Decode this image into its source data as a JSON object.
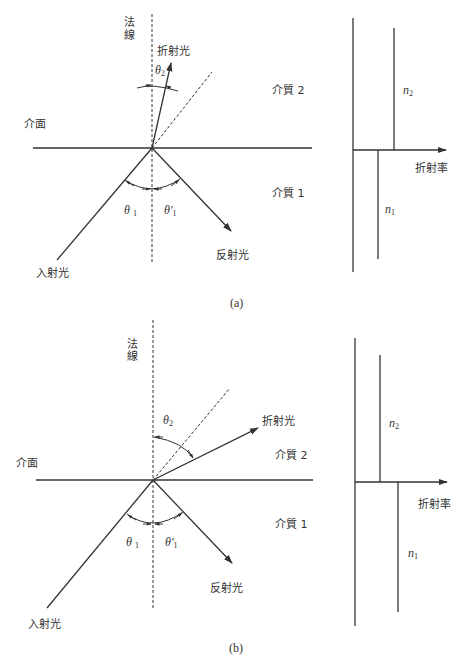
{
  "figure_a": {
    "caption": "(a)",
    "labels": {
      "normal_line_1": "法",
      "normal_line_2": "線",
      "refracted_light": "折射光",
      "interface": "介面",
      "medium_2": "介質 2",
      "medium_1": "介質 1",
      "incident_light": "入射光",
      "reflected_light": "反射光",
      "theta2": "θ",
      "theta2_sub": "2",
      "theta1": "θ",
      "theta1_sub": "1",
      "theta1p": "θ′",
      "theta1p_sub": "1"
    },
    "index_chart": {
      "axis_label": "折射率",
      "n2_label": "n",
      "n2_sub": "2",
      "n1_label": "n",
      "n1_sub": "1",
      "relation": "n2 > n1"
    }
  },
  "figure_b": {
    "caption": "(b)",
    "labels": {
      "normal_line_1": "法",
      "normal_line_2": "線",
      "refracted_light": "折射光",
      "interface": "介面",
      "medium_2": "介質 2",
      "medium_1": "介質 1",
      "incident_light": "入射光",
      "reflected_light": "反射光",
      "theta2": "θ",
      "theta2_sub": "2",
      "theta1": "θ",
      "theta1_sub": "1",
      "theta1p": "θ′",
      "theta1p_sub": "1"
    },
    "index_chart": {
      "axis_label": "折射率",
      "n2_label": "n",
      "n2_sub": "2",
      "n1_label": "n",
      "n1_sub": "1",
      "relation": "n1 > n2"
    }
  },
  "colors": {
    "line": "#333333",
    "background": "#ffffff"
  }
}
